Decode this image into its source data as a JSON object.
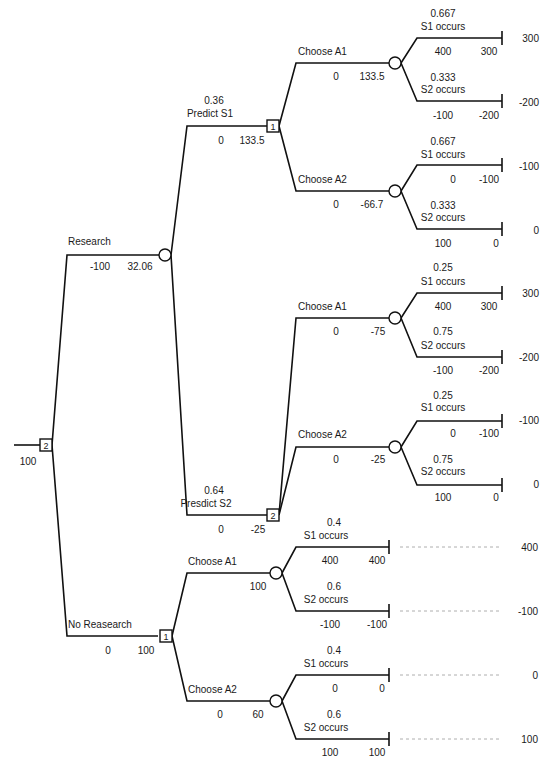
{
  "diagram": {
    "type": "decision-tree",
    "root": {
      "node_type": "decision",
      "node_number": "2",
      "value": "100"
    },
    "research": {
      "label": "Research",
      "cost": "-100",
      "value": "32.06",
      "predict_s1": {
        "prob": "0.36",
        "label": "Predict S1",
        "cost": "0",
        "value": "133.5",
        "node_number": "1",
        "choose_a1": {
          "label": "Choose A1",
          "cost": "0",
          "value": "133.5",
          "s1": {
            "prob": "0.667",
            "label": "S1 occurs",
            "payoff": "400",
            "cum": "300",
            "outcome": "300"
          },
          "s2": {
            "prob": "0.333",
            "label": "S2 occurs",
            "payoff": "-100",
            "cum": "-200",
            "outcome": "-200"
          }
        },
        "choose_a2": {
          "label": "Choose A2",
          "cost": "0",
          "value": "-66.7",
          "s1": {
            "prob": "0.667",
            "label": "S1 occurs",
            "payoff": "0",
            "cum": "-100",
            "outcome": "-100"
          },
          "s2": {
            "prob": "0.333",
            "label": "S2 occurs",
            "payoff": "100",
            "cum": "0",
            "outcome": "0"
          }
        }
      },
      "predict_s2": {
        "prob": "0.64",
        "label": "Presdict S2",
        "cost": "0",
        "value": "-25",
        "node_number": "2",
        "choose_a1": {
          "label": "Choose A1",
          "cost": "0",
          "value": "-75",
          "s1": {
            "prob": "0.25",
            "label": "S1 occurs",
            "payoff": "400",
            "cum": "300",
            "outcome": "300"
          },
          "s2": {
            "prob": "0.75",
            "label": "S2 occurs",
            "payoff": "-100",
            "cum": "-200",
            "outcome": "-200"
          }
        },
        "choose_a2": {
          "label": "Choose A2",
          "cost": "0",
          "value": "-25",
          "s1": {
            "prob": "0.25",
            "label": "S1 occurs",
            "payoff": "0",
            "cum": "-100",
            "outcome": "-100"
          },
          "s2": {
            "prob": "0.75",
            "label": "S2 occurs",
            "payoff": "100",
            "cum": "0",
            "outcome": "0"
          }
        }
      }
    },
    "no_research": {
      "label": "No Reasearch",
      "cost": "0",
      "value": "100",
      "node_number": "1",
      "choose_a1": {
        "label": "Choose A1",
        "value": "100",
        "s1": {
          "prob": "0.4",
          "label": "S1 occurs",
          "payoff": "400",
          "cum": "400",
          "outcome": "400"
        },
        "s2": {
          "prob": "0.6",
          "label": "S2 occurs",
          "payoff": "-100",
          "cum": "-100",
          "outcome": "-100"
        }
      },
      "choose_a2": {
        "label": "Choose A2",
        "cost": "0",
        "value": "60",
        "s1": {
          "prob": "0.4",
          "label": "S1 occurs",
          "payoff": "0",
          "cum": "0",
          "outcome": "0"
        },
        "s2": {
          "prob": "0.6",
          "label": "S2 occurs",
          "payoff": "100",
          "cum": "100",
          "outcome": "100"
        }
      }
    }
  }
}
